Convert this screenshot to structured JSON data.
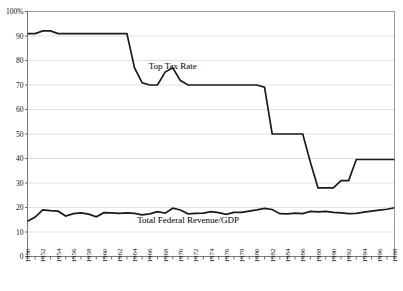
{
  "chart_data": {
    "type": "line",
    "title": "",
    "xlabel": "",
    "ylabel": "",
    "grid": true,
    "legend_position": "inline-annotation",
    "xlim": [
      1950,
      1998
    ],
    "ylim": [
      0,
      100
    ],
    "y_ticks": [
      "100%",
      "90",
      "80",
      "70",
      "60",
      "50",
      "40",
      "30",
      "20",
      "10",
      "0"
    ],
    "y_tick_values": [
      100,
      90,
      80,
      70,
      60,
      50,
      40,
      30,
      20,
      10,
      0
    ],
    "x_tick_labels": [
      "1950",
      "1952",
      "1954",
      "1956",
      "1958",
      "1960",
      "1962",
      "1964",
      "1966",
      "1968",
      "1970",
      "1972",
      "1974",
      "1976",
      "1978",
      "1980",
      "1982",
      "1984",
      "1986",
      "1988",
      "1990",
      "1992",
      "1994",
      "1996",
      "1998"
    ],
    "x": [
      1950,
      1951,
      1952,
      1953,
      1954,
      1955,
      1956,
      1957,
      1958,
      1959,
      1960,
      1961,
      1962,
      1963,
      1964,
      1965,
      1966,
      1967,
      1968,
      1969,
      1970,
      1971,
      1972,
      1973,
      1974,
      1975,
      1976,
      1977,
      1978,
      1979,
      1980,
      1981,
      1982,
      1983,
      1984,
      1985,
      1986,
      1987,
      1988,
      1989,
      1990,
      1991,
      1992,
      1993,
      1994,
      1995,
      1996,
      1997,
      1998
    ],
    "series": [
      {
        "name": "Top Tax Rate",
        "annotation": "Top Tax Rate",
        "annotation_x": 1969,
        "annotation_y": 76.5,
        "values": [
          91,
          91,
          92.1,
          92.1,
          91,
          91,
          91,
          91,
          91,
          91,
          91,
          91,
          91,
          91,
          77,
          70.9,
          70,
          70,
          75.3,
          77,
          71.8,
          70,
          70,
          70,
          70,
          70,
          70,
          70,
          70,
          70,
          70,
          69.1,
          50,
          50,
          50,
          50,
          50,
          38.5,
          28,
          28,
          28,
          31,
          31,
          39.6,
          39.6,
          39.6,
          39.6,
          39.6,
          39.6
        ]
      },
      {
        "name": "Total Federal Revenue/GDP",
        "annotation": "Total Federal Revenue/GDP",
        "annotation_x": 1971,
        "annotation_y": 13.5,
        "values": [
          14.4,
          16.1,
          19.0,
          18.7,
          18.5,
          16.5,
          17.5,
          17.8,
          17.3,
          16.2,
          17.9,
          17.8,
          17.6,
          17.8,
          17.6,
          17.0,
          17.4,
          18.3,
          17.7,
          19.7,
          19.0,
          17.4,
          17.6,
          17.7,
          18.3,
          17.9,
          17.2,
          18.0,
          18.0,
          18.5,
          19.0,
          19.6,
          19.2,
          17.5,
          17.4,
          17.7,
          17.5,
          18.4,
          18.2,
          18.4,
          18.0,
          17.8,
          17.5,
          17.6,
          18.1,
          18.5,
          18.9,
          19.3,
          19.9
        ]
      }
    ]
  },
  "colors": {
    "line": "#1a1a1a",
    "grid": "#d9d9d9",
    "frame": "#9a9a9a",
    "background": "#ffffff",
    "text": "#111111"
  }
}
